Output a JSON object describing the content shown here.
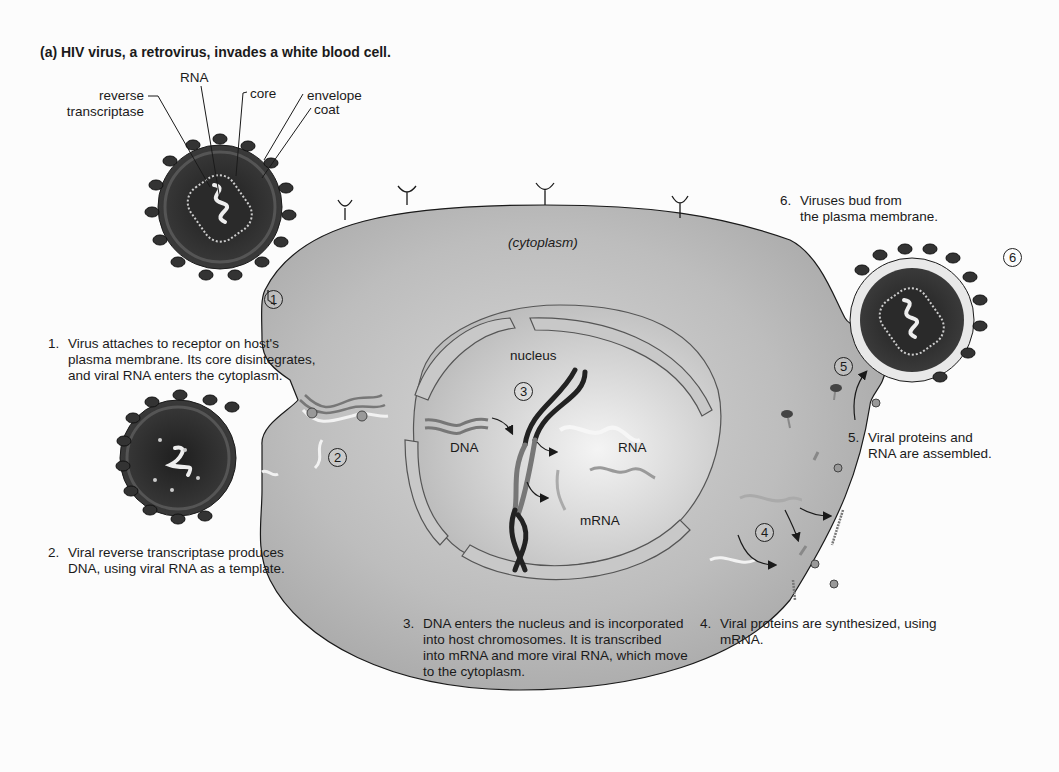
{
  "figure": {
    "title": "(a)  HIV virus, a retrovirus, invades a white blood cell."
  },
  "virus_labels": {
    "rna": "RNA",
    "reverse_transcriptase": "reverse\ntranscriptase",
    "core": "core",
    "envelope": "envelope",
    "coat": "coat"
  },
  "cell_labels": {
    "cytoplasm": "(cytoplasm)",
    "nucleus": "nucleus",
    "dna": "DNA",
    "rna": "RNA",
    "mrna": "mRNA"
  },
  "step_markers": [
    "1",
    "2",
    "3",
    "4",
    "5",
    "6"
  ],
  "steps": [
    {
      "num": "1.",
      "text": "Virus attaches to receptor on host's\nplasma membrane. Its core disintegrates,\nand viral RNA enters the cytoplasm."
    },
    {
      "num": "2.",
      "text": "Viral reverse transcriptase produces\nDNA, using viral RNA as a template."
    },
    {
      "num": "3.",
      "text": "DNA enters the nucleus and is incorporated\ninto host chromosomes. It is transcribed\ninto mRNA and more viral RNA, which move\nto the cytoplasm."
    },
    {
      "num": "4.",
      "text": "Viral proteins are synthesized, using\nmRNA."
    },
    {
      "num": "5.",
      "text": "Viral proteins and\nRNA are assembled."
    },
    {
      "num": "6.",
      "text": "Viruses bud from\nthe plasma membrane."
    }
  ],
  "colors": {
    "cytoplasm": "#b8b8b8",
    "virus_dark": "#2a2a2a",
    "line": "#1a1a1a"
  }
}
